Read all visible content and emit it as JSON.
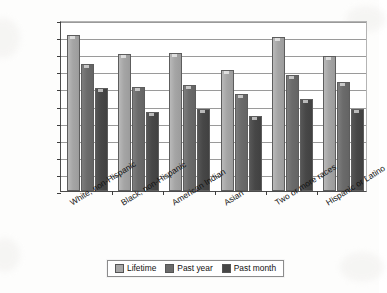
{
  "chart_data": {
    "type": "bar",
    "title": "",
    "xlabel": "",
    "ylabel": "Percentage of respondents",
    "ylim": [
      0,
      100
    ],
    "ytick_step": 10,
    "yticks": [
      100,
      90,
      80,
      70,
      60,
      50,
      40,
      30,
      20,
      10,
      0
    ],
    "grid": true,
    "legend_position": "bottom-center",
    "categories": [
      "White, non-Hispanic",
      "Black, non-Hispanic",
      "American Indian",
      "Asian",
      "Two or more races",
      "Hispanic or Latino"
    ],
    "series": [
      {
        "name": "Lifetime",
        "color": "#a7a7a7",
        "values": [
          91,
          80,
          81,
          71,
          90,
          79
        ]
      },
      {
        "name": "Past year",
        "color": "#6b6b6b",
        "values": [
          74,
          61,
          62,
          57,
          68,
          64
        ]
      },
      {
        "name": "Past month",
        "color": "#464646",
        "values": [
          60,
          46,
          48,
          44,
          54,
          48
        ]
      }
    ]
  },
  "legend": {
    "items": [
      {
        "label": "Lifetime"
      },
      {
        "label": "Past year"
      },
      {
        "label": "Past month"
      }
    ]
  }
}
